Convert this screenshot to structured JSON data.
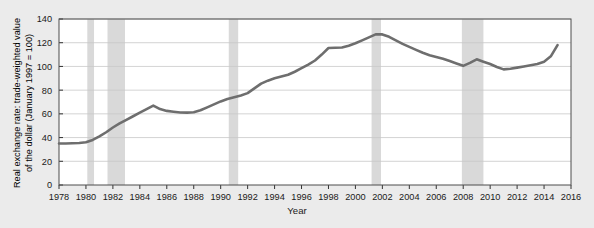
{
  "figure": {
    "background_color": "#ebebeb",
    "plot_background_color": "#ffffff"
  },
  "chart_data": {
    "type": "line",
    "title": "",
    "subtitle": "",
    "xlabel": "Year",
    "ylabel": "Real exchange rate: trade-weighted value of the dollar (January 1997 = 100)",
    "ylabel_line1": "Real exchange rate: trade-weighted value",
    "ylabel_line2": "of the dollar (January 1997 = 100)",
    "xlim": [
      1978,
      2016
    ],
    "ylim": [
      0,
      140
    ],
    "xticks": [
      1978,
      1980,
      1982,
      1984,
      1986,
      1988,
      1990,
      1992,
      1994,
      1996,
      1998,
      2000,
      2002,
      2004,
      2006,
      2008,
      2010,
      2012,
      2014,
      2016
    ],
    "xtick_labels": [
      "1978",
      "1980",
      "1982",
      "1984",
      "1986",
      "1988",
      "1990",
      "1992",
      "1994",
      "1996",
      "1998",
      "2000",
      "2002",
      "2004",
      "2006",
      "2008",
      "2010",
      "2012",
      "2014",
      "2016"
    ],
    "yticks": [
      0,
      20,
      40,
      60,
      80,
      100,
      120,
      140
    ],
    "ytick_labels": [
      "0",
      "20",
      "40",
      "60",
      "80",
      "100",
      "120",
      "140"
    ],
    "grid": "horizontal",
    "legend": "none",
    "line_color": "#6e6e6e",
    "line_width": 2.6,
    "series": [
      {
        "name": "Real exchange rate: trade-weighted value of the dollar",
        "x": [
          1978.0,
          1978.5,
          1979.0,
          1979.5,
          1980.0,
          1980.5,
          1981.0,
          1981.5,
          1982.0,
          1982.5,
          1983.0,
          1983.5,
          1984.0,
          1984.5,
          1985.0,
          1985.5,
          1986.0,
          1986.5,
          1987.0,
          1987.5,
          1988.0,
          1988.5,
          1989.0,
          1989.5,
          1990.0,
          1990.5,
          1991.0,
          1991.5,
          1992.0,
          1992.5,
          1993.0,
          1993.5,
          1994.0,
          1994.5,
          1995.0,
          1995.5,
          1996.0,
          1996.5,
          1997.0,
          1997.5,
          1998.0,
          1998.5,
          1999.0,
          1999.5,
          2000.0,
          2000.5,
          2001.0,
          2001.5,
          2002.0,
          2002.5,
          2003.0,
          2003.5,
          2004.0,
          2004.5,
          2005.0,
          2005.5,
          2006.0,
          2006.5,
          2007.0,
          2007.5,
          2008.0,
          2008.5,
          2009.0,
          2009.5,
          2010.0,
          2010.5,
          2011.0,
          2011.5,
          2012.0,
          2012.5,
          2013.0,
          2013.5,
          2014.0,
          2014.5,
          2015.0
        ],
        "y": [
          35.0,
          35.0,
          35.2,
          35.4,
          36.0,
          38.0,
          41.0,
          44.5,
          48.5,
          52.0,
          55.0,
          58.0,
          61.0,
          64.0,
          67.0,
          64.0,
          62.5,
          61.8,
          61.2,
          61.0,
          61.3,
          63.0,
          65.5,
          68.0,
          70.5,
          72.5,
          74.0,
          75.5,
          77.5,
          81.5,
          85.5,
          88.0,
          90.0,
          91.5,
          93.0,
          95.5,
          98.5,
          101.5,
          105.0,
          110.0,
          115.5,
          115.8,
          116.0,
          117.5,
          119.5,
          122.0,
          124.5,
          127.0,
          127.0,
          125.0,
          122.0,
          119.0,
          116.5,
          114.0,
          111.5,
          109.5,
          108.0,
          106.5,
          104.5,
          102.5,
          100.5,
          103.0,
          106.0,
          104.0,
          102.0,
          99.5,
          97.5,
          98.0,
          99.0,
          100.0,
          101.0,
          102.0,
          104.0,
          108.5,
          118.0
        ]
      }
    ],
    "shaded_bands": [
      {
        "name": "recession-1980",
        "start": 1980.1,
        "end": 1980.6
      },
      {
        "name": "recession-1981-1982",
        "start": 1981.6,
        "end": 1982.9
      },
      {
        "name": "recession-1990-1991",
        "start": 1990.6,
        "end": 1991.3
      },
      {
        "name": "recession-2001",
        "start": 2001.2,
        "end": 2001.9
      },
      {
        "name": "recession-2007-2009",
        "start": 2007.9,
        "end": 2009.5
      },
      {
        "name": "band-color",
        "color": "#d9d9d9"
      }
    ],
    "shaded_band_color": "#d9d9d9",
    "shaded_band_meaning": "recession"
  }
}
